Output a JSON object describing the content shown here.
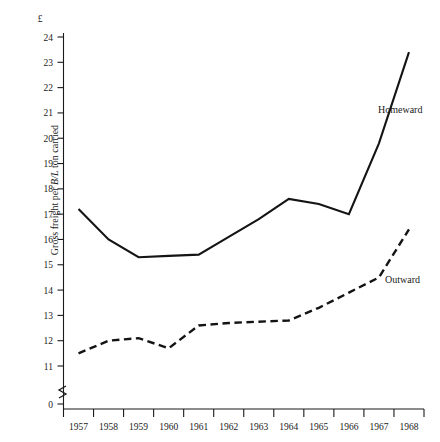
{
  "chart_data": {
    "type": "line",
    "title": "",
    "subtitle": "",
    "xlabel": "",
    "ylabel": "Gross freight per B/L ton carried",
    "ylabel_parts": {
      "before": "Gross freight per ",
      "italic": "B/L",
      "after": " ton carried"
    },
    "currency_symbol": "£",
    "categories": [
      "1957",
      "1958",
      "1959",
      "1960",
      "1961",
      "1962",
      "1963",
      "1964",
      "1965",
      "1966",
      "1967",
      "1968"
    ],
    "x": [
      1957,
      1958,
      1959,
      1960,
      1961,
      1962,
      1963,
      1964,
      1965,
      1966,
      1967,
      1968
    ],
    "ylim": [
      11,
      24
    ],
    "y_ticks": [
      24,
      23,
      22,
      21,
      20,
      19,
      18,
      17,
      16,
      15,
      14,
      13,
      12,
      11
    ],
    "y_tick_labels": [
      "24",
      "23",
      "22",
      "21",
      "20",
      "19",
      "18",
      "17",
      "16",
      "15",
      "14",
      "13",
      "12",
      "11"
    ],
    "zero_tick_label": "0",
    "axis_break": true,
    "grid": false,
    "legend": "inline-annotations",
    "series": [
      {
        "name": "Homeward",
        "style": "solid",
        "label_position": "right-upper",
        "values": [
          17.2,
          16.0,
          15.3,
          15.35,
          15.4,
          16.1,
          16.8,
          17.6,
          17.4,
          17.0,
          19.8,
          23.4
        ]
      },
      {
        "name": "Outward",
        "style": "dashed",
        "label_position": "right-lower",
        "values": [
          11.5,
          12.0,
          12.1,
          11.7,
          12.6,
          12.7,
          12.75,
          12.8,
          13.3,
          13.9,
          14.5,
          16.4
        ]
      }
    ]
  }
}
